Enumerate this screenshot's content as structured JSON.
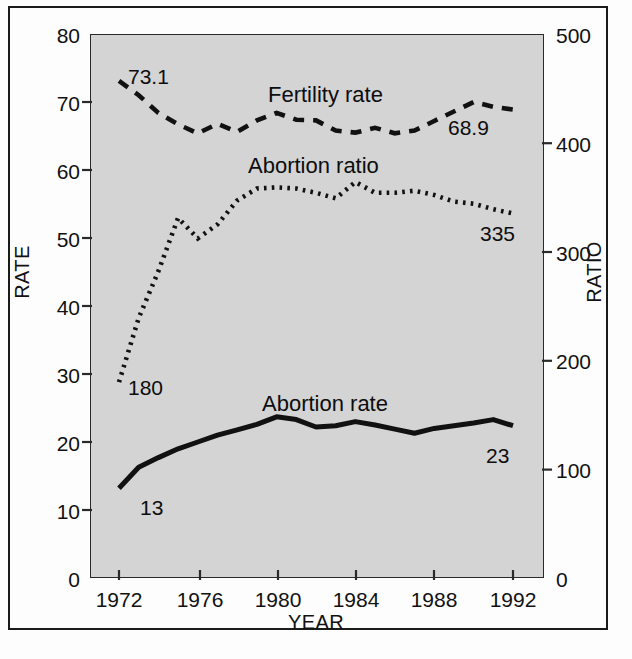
{
  "chart_data": {
    "type": "line",
    "title": "",
    "xlabel": "YEAR",
    "ylabel": "RATE",
    "ylabel_right": "RATIO",
    "grid": false,
    "legend": "inline-annotations",
    "x": [
      1972,
      1973,
      1974,
      1975,
      1976,
      1977,
      1978,
      1979,
      1980,
      1981,
      1982,
      1983,
      1984,
      1985,
      1986,
      1987,
      1988,
      1989,
      1990,
      1991,
      1992
    ],
    "xticks": [
      1972,
      1976,
      1980,
      1984,
      1988,
      1992
    ],
    "xlim": [
      1972,
      1992
    ],
    "left_axis": {
      "label": "RATE",
      "ticks": [
        0,
        10,
        20,
        30,
        40,
        50,
        60,
        70,
        80
      ],
      "lim": [
        0,
        80
      ]
    },
    "right_axis": {
      "label": "RATIO",
      "ticks": [
        0,
        100,
        200,
        300,
        400,
        500
      ],
      "lim": [
        0,
        500
      ]
    },
    "series": [
      {
        "name": "Fertility rate",
        "axis": "left",
        "style": "dashed",
        "start_label": "73.1",
        "end_label": "68.9",
        "values": [
          73.1,
          71.0,
          68.4,
          66.7,
          65.4,
          66.8,
          65.6,
          67.3,
          68.4,
          67.4,
          67.3,
          65.8,
          65.5,
          66.2,
          65.4,
          65.8,
          67.2,
          68.6,
          70.0,
          69.3,
          68.9
        ]
      },
      {
        "name": "Abortion ratio",
        "axis": "right",
        "style": "dotted",
        "start_label": "180",
        "end_label": "335",
        "values": [
          180,
          239,
          282,
          331,
          312,
          325,
          347,
          358,
          359,
          358,
          354,
          349,
          364,
          354,
          354,
          356,
          352,
          346,
          344,
          339,
          335
        ]
      },
      {
        "name": "Abortion rate",
        "axis": "left",
        "style": "solid",
        "start_label": "13",
        "end_label": "23",
        "values": [
          13.2,
          16.3,
          17.7,
          19.0,
          20.0,
          21.0,
          21.8,
          22.6,
          23.7,
          23.3,
          22.2,
          22.4,
          23.0,
          22.5,
          21.9,
          21.3,
          22.0,
          22.4,
          22.8,
          23.3,
          22.4
        ]
      }
    ]
  },
  "axis": {
    "left_ticks": [
      "80",
      "70",
      "60",
      "50",
      "40",
      "30",
      "20",
      "10",
      "0"
    ],
    "right_ticks": [
      "500",
      "400",
      "300",
      "200",
      "100",
      "0"
    ],
    "x_ticks": [
      "1972",
      "1976",
      "1980",
      "1984",
      "1988",
      "1992"
    ],
    "left_title": "RATE",
    "right_title": "RATIO",
    "x_title": "YEAR"
  },
  "annotations": {
    "fertility_name": "Fertility rate",
    "fertility_start": "73.1",
    "fertility_end": "68.9",
    "ratio_name": "Abortion ratio",
    "ratio_start": "180",
    "ratio_end": "335",
    "rate_name": "Abortion rate",
    "rate_start": "13",
    "rate_end": "23"
  },
  "colors": {
    "plot_background": "#d4d4d4",
    "page_background": "#fdfdfd",
    "ink": "#111111",
    "frame": "#1b1b1b"
  }
}
